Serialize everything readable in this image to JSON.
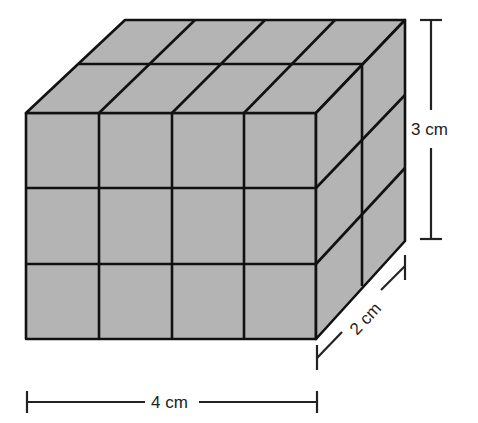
{
  "figure": {
    "cubes": {
      "length": 4,
      "depth": 2,
      "height": 3,
      "total": 24
    },
    "labels": {
      "length": "4 cm",
      "depth": "2 cm",
      "height": "3 cm"
    },
    "colors": {
      "fill": "#b4b4b4",
      "line": "#111111",
      "background": "#ffffff"
    }
  }
}
